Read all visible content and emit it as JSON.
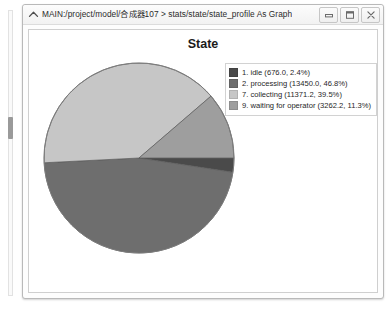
{
  "window": {
    "title": "MAIN:/project/model/合成器107 > stats/state/state_profile As Graph",
    "icon": "chevron-up-icon",
    "buttons": {
      "minimize": "minimize-icon",
      "maximize": "maximize-icon",
      "close": "close-icon"
    }
  },
  "chart_data": {
    "type": "pie",
    "title": "State",
    "xlabel": "",
    "ylabel": "",
    "legend_position": "right",
    "grid": false,
    "categories": [
      "1. idle",
      "2. processing",
      "7. collecting",
      "9. waiting for operator"
    ],
    "values": [
      676.0,
      13450.0,
      11371.2,
      3262.2
    ],
    "percents": [
      2.4,
      46.8,
      39.5,
      11.3
    ],
    "colors": [
      "#4a4a4a",
      "#6e6e6e",
      "#c6c6c6",
      "#9e9e9e"
    ],
    "legend_entries": [
      "1. idle (676.0, 2.4%)",
      "2. processing (13450.0, 46.8%)",
      "7. collecting (11371.2, 39.5%)",
      "9. waiting for operator (3262.2, 11.3%)"
    ],
    "slices": [
      {
        "label": "1. idle",
        "value": 676.0,
        "percent": 2.4,
        "color": "#4a4a4a",
        "legend": "1. idle (676.0, 2.4%)"
      },
      {
        "label": "2. processing",
        "value": 13450.0,
        "percent": 46.8,
        "color": "#6e6e6e",
        "legend": "2. processing (13450.0, 46.8%)"
      },
      {
        "label": "7. collecting",
        "value": 11371.2,
        "percent": 39.5,
        "color": "#c6c6c6",
        "legend": "7. collecting (11371.2, 39.5%)"
      },
      {
        "label": "9. waiting for operator",
        "value": 3262.2,
        "percent": 11.3,
        "color": "#9e9e9e",
        "legend": "9. waiting for operator (3262.2, 11.3%)"
      }
    ]
  }
}
